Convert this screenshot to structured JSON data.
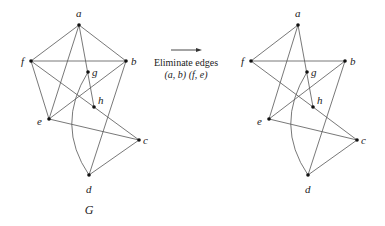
{
  "operation": {
    "line1": "Eliminate edges",
    "line2": "(a, b) (f, e)",
    "arrow": {
      "x1": 171,
      "y1": 50,
      "x2": 201,
      "y2": 50
    }
  },
  "graphs": [
    {
      "id": "G",
      "caption": "G",
      "caption_pos": [
        89,
        214
      ],
      "nodes": {
        "a": {
          "x": 79,
          "y": 25,
          "lx": 76,
          "ly": 17
        },
        "b": {
          "x": 126,
          "y": 61,
          "lx": 131,
          "ly": 65
        },
        "c": {
          "x": 139,
          "y": 140,
          "lx": 143,
          "ly": 144
        },
        "d": {
          "x": 89,
          "y": 175,
          "lx": 86,
          "ly": 193
        },
        "e": {
          "x": 49,
          "y": 119,
          "lx": 37,
          "ly": 125
        },
        "f": {
          "x": 31,
          "y": 61,
          "lx": 21,
          "ly": 65
        },
        "g": {
          "x": 88,
          "y": 72,
          "lx": 92,
          "ly": 76
        },
        "h": {
          "x": 94,
          "y": 107,
          "lx": 98,
          "ly": 104
        }
      },
      "edges": [
        [
          "a",
          "f"
        ],
        [
          "a",
          "b"
        ],
        [
          "a",
          "e"
        ],
        [
          "a",
          "h"
        ],
        [
          "f",
          "b"
        ],
        [
          "f",
          "e"
        ],
        [
          "f",
          "h"
        ],
        [
          "h",
          "c"
        ],
        [
          "b",
          "e"
        ],
        [
          "b",
          "d"
        ],
        [
          "e",
          "c"
        ],
        [
          "c",
          "d"
        ]
      ],
      "curved_edges": [
        {
          "from": "g",
          "to": "d",
          "cx": 55,
          "cy": 125
        }
      ]
    },
    {
      "id": "G-prime",
      "caption": "",
      "nodes": {
        "a": {
          "x": 298,
          "y": 25,
          "lx": 295,
          "ly": 17
        },
        "b": {
          "x": 345,
          "y": 61,
          "lx": 350,
          "ly": 65
        },
        "c": {
          "x": 357,
          "y": 140,
          "lx": 361,
          "ly": 144
        },
        "d": {
          "x": 308,
          "y": 175,
          "lx": 305,
          "ly": 193
        },
        "e": {
          "x": 269,
          "y": 119,
          "lx": 257,
          "ly": 125
        },
        "f": {
          "x": 251,
          "y": 61,
          "lx": 241,
          "ly": 65
        },
        "g": {
          "x": 307,
          "y": 72,
          "lx": 311,
          "ly": 76
        },
        "h": {
          "x": 313,
          "y": 107,
          "lx": 317,
          "ly": 104
        }
      },
      "edges": [
        [
          "a",
          "f"
        ],
        [
          "a",
          "e"
        ],
        [
          "a",
          "h"
        ],
        [
          "f",
          "b"
        ],
        [
          "f",
          "h"
        ],
        [
          "h",
          "c"
        ],
        [
          "b",
          "e"
        ],
        [
          "b",
          "d"
        ],
        [
          "e",
          "c"
        ],
        [
          "c",
          "d"
        ]
      ],
      "curved_edges": [
        {
          "from": "g",
          "to": "d",
          "cx": 274,
          "cy": 125
        }
      ]
    }
  ]
}
